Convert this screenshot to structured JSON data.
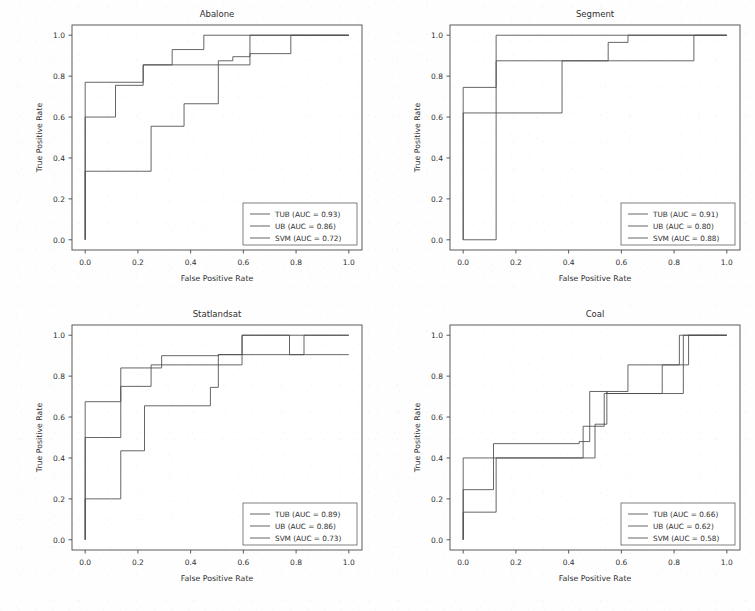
{
  "figure": {
    "background_color": "#fefefe",
    "line_color": "#4a4a4a",
    "axis_color": "#4a4a4a",
    "text_color": "#2f2f2f",
    "rows": 2,
    "cols": 2
  },
  "axis_labels": {
    "x": "False Positive Rate",
    "y": "True Positive Rate"
  },
  "ticks": {
    "x": [
      "0.0",
      "0.2",
      "0.4",
      "0.6",
      "0.8",
      "1.0"
    ],
    "y": [
      "0.0",
      "0.2",
      "0.4",
      "0.6",
      "0.8",
      "1.0"
    ],
    "x_values": [
      0.0,
      0.2,
      0.4,
      0.6,
      0.8,
      1.0
    ],
    "y_values": [
      0.0,
      0.2,
      0.4,
      0.6,
      0.8,
      1.0
    ]
  },
  "chart_data": [
    {
      "type": "line",
      "title": "Abalone",
      "xlabel": "False Positive Rate",
      "ylabel": "True Positive Rate",
      "xlim": [
        -0.05,
        1.05
      ],
      "ylim": [
        -0.05,
        1.05
      ],
      "grid": false,
      "legend_position": "lower right",
      "drawstyle": "steps-post",
      "series": [
        {
          "name": "TUB (AUC = 0.93)",
          "label": "TUB",
          "auc": 0.93,
          "color": "#4a4a4a",
          "x": [
            0.0,
            0.0,
            0.22,
            0.22,
            0.33,
            0.33,
            0.45,
            0.45,
            1.0
          ],
          "y": [
            0.0,
            0.77,
            0.77,
            0.855,
            0.855,
            0.93,
            0.93,
            1.0,
            1.0
          ]
        },
        {
          "name": "UB (AUC = 0.86)",
          "label": "UB",
          "auc": 0.86,
          "color": "#4a4a4a",
          "x": [
            0.0,
            0.0,
            0.115,
            0.115,
            0.22,
            0.22,
            0.33,
            0.33,
            0.505,
            0.505,
            0.56,
            0.56,
            0.625,
            0.625,
            0.78,
            0.78,
            1.0
          ],
          "y": [
            0.0,
            0.6,
            0.6,
            0.755,
            0.755,
            0.855,
            0.855,
            0.855,
            0.855,
            0.875,
            0.875,
            0.895,
            0.895,
            0.91,
            0.91,
            1.0,
            1.0
          ]
        },
        {
          "name": "SVM (AUC = 0.72)",
          "label": "SVM",
          "auc": 0.72,
          "color": "#4a4a4a",
          "x": [
            0.0,
            0.0,
            0.25,
            0.25,
            0.375,
            0.375,
            0.505,
            0.505,
            0.625,
            0.625,
            1.0
          ],
          "y": [
            0.0,
            0.335,
            0.335,
            0.555,
            0.555,
            0.665,
            0.665,
            0.855,
            0.855,
            1.0,
            1.0
          ]
        }
      ]
    },
    {
      "type": "line",
      "title": "Segment",
      "xlabel": "False Positive Rate",
      "ylabel": "True Positive Rate",
      "xlim": [
        -0.05,
        1.05
      ],
      "ylim": [
        -0.05,
        1.05
      ],
      "grid": false,
      "legend_position": "lower right",
      "drawstyle": "steps-post",
      "series": [
        {
          "name": "TUB (AUC = 0.91)",
          "label": "TUB",
          "auc": 0.91,
          "color": "#4a4a4a",
          "x": [
            0.0,
            0.0,
            0.125,
            0.125,
            1.0
          ],
          "y": [
            0.0,
            0.0,
            0.0,
            1.0,
            1.0
          ]
        },
        {
          "name": "UB (AUC = 0.80)",
          "label": "UB",
          "auc": 0.8,
          "color": "#4a4a4a",
          "x": [
            0.0,
            0.0,
            0.375,
            0.375,
            0.875,
            0.875,
            1.0
          ],
          "y": [
            0.0,
            0.62,
            0.62,
            0.875,
            0.875,
            1.0,
            1.0
          ]
        },
        {
          "name": "SVM (AUC = 0.88)",
          "label": "SVM",
          "auc": 0.88,
          "color": "#4a4a4a",
          "x": [
            0.0,
            0.0,
            0.125,
            0.125,
            0.55,
            0.55,
            0.625,
            0.625,
            1.0
          ],
          "y": [
            0.0,
            0.745,
            0.745,
            0.875,
            0.875,
            0.965,
            0.965,
            1.0,
            1.0
          ]
        }
      ]
    },
    {
      "type": "line",
      "title": "Statlandsat",
      "xlabel": "False Positive Rate",
      "ylabel": "True Positive Rate",
      "xlim": [
        -0.05,
        1.05
      ],
      "ylim": [
        -0.05,
        1.05
      ],
      "grid": false,
      "legend_position": "lower right",
      "drawstyle": "steps-post",
      "series": [
        {
          "name": "TUB (AUC = 0.89)",
          "label": "TUB",
          "auc": 0.89,
          "color": "#4a4a4a",
          "x": [
            0.0,
            0.0,
            0.135,
            0.135,
            0.29,
            0.29,
            0.505,
            0.505,
            0.595,
            0.595,
            0.775,
            0.775,
            0.83,
            0.83,
            1.0
          ],
          "y": [
            0.0,
            0.675,
            0.675,
            0.84,
            0.84,
            0.9,
            0.9,
            0.905,
            0.905,
            1.0,
            1.0,
            0.905,
            0.905,
            1.0,
            1.0
          ]
        },
        {
          "name": "UB (AUC = 0.86)",
          "label": "UB",
          "auc": 0.86,
          "color": "#4a4a4a",
          "x": [
            0.0,
            0.0,
            0.135,
            0.135,
            0.25,
            0.25,
            0.5,
            0.5,
            0.595,
            0.595,
            1.0
          ],
          "y": [
            0.0,
            0.5,
            0.5,
            0.75,
            0.75,
            0.855,
            0.855,
            0.855,
            0.855,
            1.0,
            1.0
          ]
        },
        {
          "name": "SVM (AUC = 0.73)",
          "label": "SVM",
          "auc": 0.73,
          "color": "#4a4a4a",
          "x": [
            0.0,
            0.0,
            0.1,
            0.1,
            0.135,
            0.135,
            0.225,
            0.225,
            0.29,
            0.29,
            0.475,
            0.475,
            0.505,
            0.505,
            1.0
          ],
          "y": [
            0.0,
            0.2,
            0.2,
            0.2,
            0.2,
            0.435,
            0.435,
            0.655,
            0.655,
            0.655,
            0.655,
            0.745,
            0.745,
            0.905,
            0.905
          ]
        }
      ]
    },
    {
      "type": "line",
      "title": "Coal",
      "xlabel": "False Positive Rate",
      "ylabel": "True Positive Rate",
      "xlim": [
        -0.05,
        1.05
      ],
      "ylim": [
        -0.05,
        1.05
      ],
      "grid": false,
      "legend_position": "lower right",
      "drawstyle": "steps-post",
      "series": [
        {
          "name": "TUB (AUC = 0.66)",
          "label": "TUB",
          "auc": 0.66,
          "color": "#4a4a4a",
          "x": [
            0.0,
            0.0,
            0.115,
            0.115,
            0.44,
            0.44,
            0.48,
            0.48,
            0.545,
            0.545,
            0.755,
            0.755,
            0.855,
            0.855,
            1.0
          ],
          "y": [
            0.0,
            0.245,
            0.245,
            0.47,
            0.47,
            0.48,
            0.48,
            0.725,
            0.725,
            0.715,
            0.715,
            0.855,
            0.855,
            1.0,
            1.0
          ]
        },
        {
          "name": "UB (AUC = 0.62)",
          "label": "UB",
          "auc": 0.62,
          "color": "#4a4a4a",
          "x": [
            0.0,
            0.0,
            0.125,
            0.125,
            0.455,
            0.455,
            0.5,
            0.5,
            0.545,
            0.545,
            0.625,
            0.625,
            0.82,
            0.82,
            0.875,
            0.875,
            1.0
          ],
          "y": [
            0.0,
            0.135,
            0.135,
            0.4,
            0.4,
            0.4,
            0.4,
            0.565,
            0.565,
            0.725,
            0.725,
            0.855,
            0.855,
            1.0,
            1.0,
            1.0,
            1.0
          ]
        },
        {
          "name": "SVM (AUC = 0.58)",
          "label": "SVM",
          "auc": 0.58,
          "color": "#4a4a4a",
          "x": [
            0.0,
            0.0,
            0.1,
            0.1,
            0.125,
            0.125,
            0.455,
            0.455,
            0.49,
            0.49,
            0.535,
            0.535,
            0.625,
            0.625,
            0.835,
            0.835,
            1.0
          ],
          "y": [
            0.0,
            0.4,
            0.4,
            0.4,
            0.4,
            0.4,
            0.4,
            0.555,
            0.555,
            0.555,
            0.555,
            0.715,
            0.715,
            0.715,
            0.715,
            1.0,
            1.0
          ]
        }
      ]
    }
  ]
}
